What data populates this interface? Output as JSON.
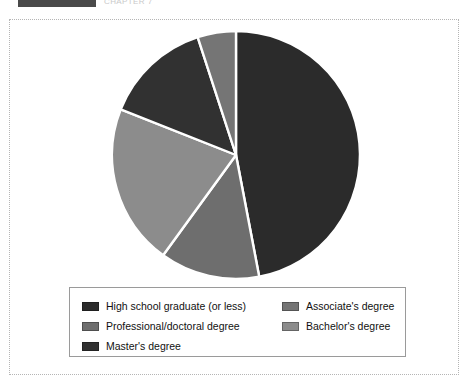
{
  "header": {
    "bar_color": "#4a4a4a",
    "caption": "CHAPTER 7"
  },
  "legend": {
    "columns": 2,
    "entries": [
      {
        "label": "High school graduate (or less)",
        "color": "#2b2b2b",
        "swatch": "legend-swatch-high-school"
      },
      {
        "label": "Associate's degree",
        "color": "#757575",
        "swatch": "legend-swatch-associates"
      },
      {
        "label": "Professional/doctoral degree",
        "color": "#6e6e6e",
        "swatch": "legend-swatch-professional"
      },
      {
        "label": "Bachelor's degree",
        "color": "#8c8c8c",
        "swatch": "legend-swatch-bachelors"
      },
      {
        "label": "Master's degree",
        "color": "#313131",
        "swatch": "legend-swatch-masters"
      }
    ]
  },
  "chart_data": {
    "type": "pie",
    "title": "",
    "subtitle": "",
    "xlabel": "",
    "ylabel": "",
    "legend_position": "bottom",
    "grid": false,
    "start_angle_deg": 0,
    "direction": "clockwise",
    "labels_on_slices": false,
    "center_px": [
      232,
      155
    ],
    "radius_px": 124,
    "slice_separator_color": "#ffffff",
    "categories": [
      "High school graduate (or less)",
      "Professional/doctoral degree",
      "Bachelor's degree",
      "Master's degree",
      "Associate's degree"
    ],
    "values": [
      47,
      13,
      21,
      14,
      5
    ],
    "units": "percent",
    "slices": [
      {
        "label": "High school graduate (or less)",
        "value": 47,
        "color": "#2b2b2b",
        "start_deg": 0,
        "end_deg": 169.2
      },
      {
        "label": "Professional/doctoral degree",
        "value": 13,
        "color": "#6e6e6e",
        "start_deg": 169.2,
        "end_deg": 216.0
      },
      {
        "label": "Bachelor's degree",
        "value": 21,
        "color": "#8c8c8c",
        "start_deg": 216.0,
        "end_deg": 291.6
      },
      {
        "label": "Master's degree",
        "value": 14,
        "color": "#313131",
        "start_deg": 291.6,
        "end_deg": 342.0
      },
      {
        "label": "Associate's degree",
        "value": 5,
        "color": "#757575",
        "start_deg": 342.0,
        "end_deg": 360.0
      }
    ]
  }
}
